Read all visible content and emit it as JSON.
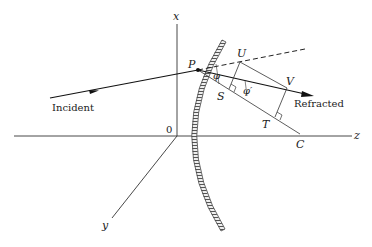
{
  "diagram": {
    "title": "",
    "axes": {
      "x_label": "x",
      "y_label": "y",
      "z_label": "z",
      "origin_label": "0"
    },
    "points": {
      "P": "P",
      "U": "U",
      "V": "V",
      "S": "S",
      "T": "T",
      "C": "C"
    },
    "angles": {
      "phi": "φ",
      "phi_prime": "φ′"
    },
    "rays": {
      "incident": "Incident",
      "refracted": "Refracted"
    },
    "colors": {
      "line": "#222222",
      "mirror_hatch": "#555555",
      "background": "#ffffff"
    }
  }
}
